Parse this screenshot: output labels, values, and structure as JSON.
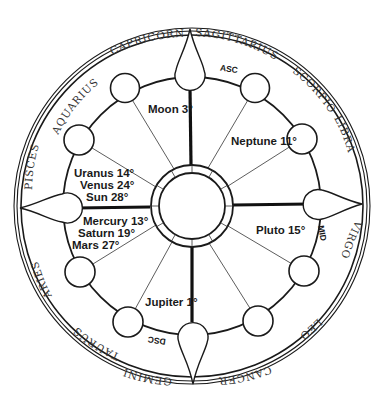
{
  "chart": {
    "type": "astrological-natal-wheel",
    "colors": {
      "line": "#1a1a1a",
      "background": "#ffffff",
      "sign_text": "#333333",
      "planet_text": "#1a1a1a"
    },
    "zodiac_signs": [
      {
        "id": "sagittarius",
        "label": "SAGITTARIUS"
      },
      {
        "id": "scorpio",
        "label": "SCORPIO"
      },
      {
        "id": "libra",
        "label": "LIBRA"
      },
      {
        "id": "virgo",
        "label": "VIRGO"
      },
      {
        "id": "leo",
        "label": "LEO"
      },
      {
        "id": "cancer",
        "label": "CANCER"
      },
      {
        "id": "gemini",
        "label": "GEMINI"
      },
      {
        "id": "taurus",
        "label": "TAURUS"
      },
      {
        "id": "aries",
        "label": "ARIES"
      },
      {
        "id": "pisces",
        "label": "PISCES"
      },
      {
        "id": "aquarius",
        "label": "AQUARIUS"
      },
      {
        "id": "capricorn",
        "label": "CAPRICORN"
      }
    ],
    "angles": {
      "ascendant": "ASC",
      "midheaven": "MID",
      "descendant": "DSC"
    },
    "planets": {
      "moon": "Moon 3°",
      "neptune": "Neptune 11°",
      "uranus": "Uranus 14°",
      "venus": "Venus 24°",
      "sun": "Sun 28°",
      "mercury": "Mercury 13°",
      "saturn": "Saturn 19°",
      "mars": "Mars 27°",
      "pluto": "Pluto 15°",
      "jupiter": "Jupiter 1°"
    }
  }
}
